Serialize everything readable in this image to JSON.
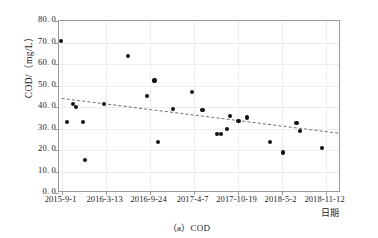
{
  "caption": "（a）COD",
  "chart_data": {
    "type": "scatter",
    "title": "",
    "subtitle": "",
    "xlabel": "日期",
    "ylabel": "COD/（mg/L）",
    "ylim": [
      0.0,
      80.0
    ],
    "ytick_labels": [
      "0. 0",
      "10. 0",
      "20. 0",
      "30. 0",
      "40. 0",
      "50. 0",
      "60. 0",
      "70. 0",
      "80. 0"
    ],
    "ytick_values": [
      0,
      10,
      20,
      30,
      40,
      50,
      60,
      70,
      80
    ],
    "xtick_labels": [
      "2015-9-1",
      "2016-3-13",
      "2016-9-24",
      "2017-4-7",
      "2017-10-19",
      "2018-5-2",
      "2018-11-12"
    ],
    "xtick_positions": [
      0,
      1,
      2,
      3,
      4,
      5,
      6
    ],
    "xlim": [
      -0.06,
      6.35
    ],
    "grid": true,
    "legend": "none",
    "marker": "filled-circle",
    "marker_color": "#111111",
    "series": [
      {
        "name": "COD",
        "points": [
          {
            "x": -0.02,
            "y": 70.8
          },
          {
            "x": 0.12,
            "y": 33.0
          },
          {
            "x": 0.25,
            "y": 41.4
          },
          {
            "x": 0.33,
            "y": 40.0
          },
          {
            "x": 0.49,
            "y": 33.0
          },
          {
            "x": 0.53,
            "y": 15.3
          },
          {
            "x": 0.97,
            "y": 41.3
          },
          {
            "x": 1.5,
            "y": 63.8
          },
          {
            "x": 1.94,
            "y": 45.2
          },
          {
            "x": 2.11,
            "y": 52.3
          },
          {
            "x": 2.19,
            "y": 23.7
          },
          {
            "x": 2.53,
            "y": 39.2
          },
          {
            "x": 2.96,
            "y": 46.9
          },
          {
            "x": 3.2,
            "y": 38.5
          },
          {
            "x": 3.54,
            "y": 27.4
          },
          {
            "x": 3.62,
            "y": 27.4
          },
          {
            "x": 3.75,
            "y": 29.6
          },
          {
            "x": 3.83,
            "y": 35.9
          },
          {
            "x": 4.02,
            "y": 33.3
          },
          {
            "x": 4.21,
            "y": 35.1
          },
          {
            "x": 4.73,
            "y": 23.8
          },
          {
            "x": 5.04,
            "y": 18.8
          },
          {
            "x": 5.34,
            "y": 32.4
          },
          {
            "x": 5.41,
            "y": 28.8
          },
          {
            "x": 5.92,
            "y": 21.0
          }
        ]
      }
    ],
    "trendline": {
      "style": "dashed",
      "color": "#6f6f6f",
      "x_start": 0.0,
      "y_start": 44.0,
      "x_end": 6.3,
      "y_end": 27.8
    }
  }
}
